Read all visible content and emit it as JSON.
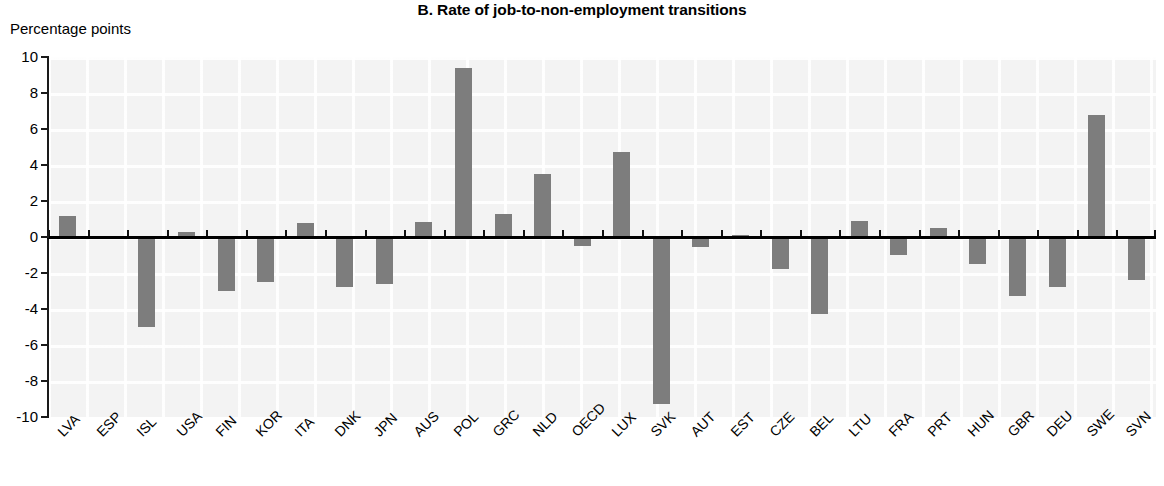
{
  "chart_data": {
    "type": "bar",
    "title": "B. Rate of job-to-non-employment transitions",
    "xlabel": "",
    "ylabel": "Percentage points",
    "ylim": [
      -10,
      10
    ],
    "yticks": [
      10,
      8,
      6,
      4,
      2,
      0,
      -2,
      -4,
      -6,
      -8,
      -10
    ],
    "ytick_labels": [
      "10",
      "8",
      "6",
      "4",
      "2",
      "0",
      "-2",
      "-4",
      "-6",
      "-8",
      "-10"
    ],
    "grid": true,
    "legend": null,
    "legend_position": "none",
    "bar_color": "#7d7d7d",
    "axis_color": "#000000",
    "plot_background": "#f2f2f2",
    "categories": [
      "LVA",
      "ESP",
      "ISL",
      "USA",
      "FIN",
      "KOR",
      "ITA",
      "DNK",
      "JPN",
      "AUS",
      "POL",
      "GRC",
      "NLD",
      "OECD",
      "LUX",
      "SVK",
      "AUT",
      "EST",
      "CZE",
      "BEL",
      "LTU",
      "FRA",
      "PRT",
      "HUN",
      "GBR",
      "DEU",
      "SWE",
      "SVN"
    ],
    "values": [
      1.15,
      0.0,
      -5.0,
      0.3,
      -3.0,
      -2.5,
      0.8,
      -2.8,
      -2.6,
      0.85,
      9.4,
      1.3,
      3.5,
      -0.5,
      4.7,
      -9.3,
      -0.55,
      0.1,
      -1.8,
      -4.3,
      0.9,
      -1.0,
      0.5,
      -1.5,
      -3.3,
      -2.8,
      6.8,
      -2.4
    ]
  },
  "header": {
    "title": "B. Rate of job-to-non-employment transitions",
    "unit_label": "Percentage points"
  }
}
